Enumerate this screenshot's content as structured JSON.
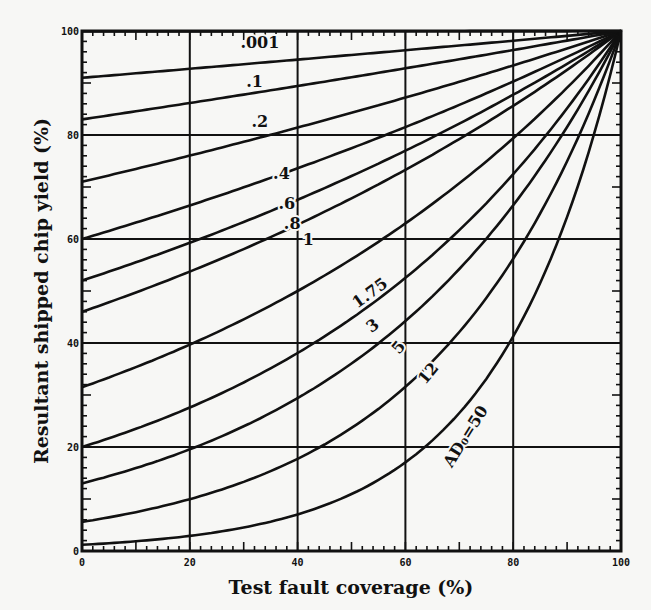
{
  "chart_data": {
    "type": "line",
    "title": "",
    "xlabel": "Test fault coverage (%)",
    "ylabel": "Resultant shipped chip yield (%)",
    "xlim": [
      0,
      100
    ],
    "ylim": [
      0,
      100
    ],
    "grid": true,
    "x_ticks": [
      0,
      20,
      40,
      60,
      80,
      100
    ],
    "y_ticks": [
      0,
      20,
      40,
      60,
      80,
      100
    ],
    "x_tick_labels": [
      "0",
      "20",
      "40",
      "60",
      "80",
      "100"
    ],
    "y_tick_labels": [
      "0",
      "20",
      "40",
      "60",
      "80",
      "100"
    ],
    "model_note": "Each curve: shipped yield = Y0^(1 - T), converging to 100% at T = 100%",
    "series": [
      {
        "name": ".001",
        "y_at_0": 99.9,
        "label": ".001",
        "label_pos": [
          33,
          96.8
        ],
        "label_rot": 0
      },
      {
        "name": ".1",
        "y_at_0": 91,
        "label": ".1",
        "label_pos": [
          32,
          89.2
        ],
        "label_rot": 0
      },
      {
        "name": ".2",
        "y_at_0": 83,
        "label": ".2",
        "label_pos": [
          33,
          81.6
        ],
        "label_rot": 0
      },
      {
        "name": ".4",
        "y_at_0": 71,
        "label": ".4",
        "label_pos": [
          37,
          71.5
        ],
        "label_rot": 0
      },
      {
        "name": ".6",
        "y_at_0": 60,
        "label": ".6",
        "label_pos": [
          38,
          65.8
        ],
        "label_rot": 0
      },
      {
        "name": ".8",
        "y_at_0": 52,
        "label": ".8",
        "label_pos": [
          39,
          62.0
        ],
        "label_rot": 0
      },
      {
        "name": "1",
        "y_at_0": 46,
        "label": "1",
        "label_pos": [
          42,
          58.8
        ],
        "label_rot": 0
      },
      {
        "name": "1.75",
        "y_at_0": 31.5,
        "label": "1.75",
        "label_pos": [
          54,
          48.8
        ],
        "label_rot": -36
      },
      {
        "name": "3",
        "y_at_0": 20,
        "label": "3",
        "label_pos": [
          54.5,
          42.5
        ],
        "label_rot": -36
      },
      {
        "name": "5",
        "y_at_0": 13,
        "label": "5",
        "label_pos": [
          59.5,
          38.5
        ],
        "label_rot": -50
      },
      {
        "name": "12",
        "y_at_0": 5.6,
        "label": "12",
        "label_pos": [
          65,
          33.5
        ],
        "label_rot": -50
      },
      {
        "name": "AD0=50",
        "y_at_0": 1.2,
        "label": "AD₀=50",
        "label_pos": [
          72,
          21.5
        ],
        "label_rot": -58
      }
    ]
  }
}
